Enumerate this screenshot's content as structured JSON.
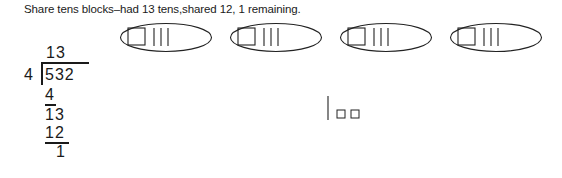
{
  "caption": "Share tens blocks–had 13 tens,shared 12, 1 remaining.",
  "groups": [
    {
      "hundreds": 1,
      "tens": 3
    },
    {
      "hundreds": 1,
      "tens": 3
    },
    {
      "hundreds": 1,
      "tens": 3
    },
    {
      "hundreds": 1,
      "tens": 3
    }
  ],
  "division": {
    "quotient": "13",
    "divisor": "4",
    "dividend": "532",
    "step1_subtract": "4",
    "step1_remainder_bringdown": "13",
    "step2_subtract": "12",
    "step2_remainder": "1"
  },
  "remaining_blocks": {
    "tens": 1,
    "ones": 2
  }
}
